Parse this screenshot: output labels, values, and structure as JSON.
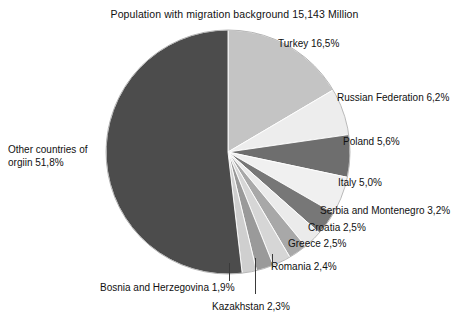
{
  "chart": {
    "title": "Population with migration background 15,143 Million",
    "geometry": {
      "center_x": 228,
      "center_y": 152,
      "radius": 122,
      "start_angle_deg": -90,
      "direction": "clockwise"
    }
  },
  "chart_data": {
    "type": "pie",
    "title": "Population with migration background 15,143 Million",
    "total_label": "15,143 Million",
    "value_suffix": "%",
    "decimal_separator": ",",
    "legend": "none",
    "grid": false,
    "categories": [
      "Turkey",
      "Russian Federation",
      "Poland",
      "Italy",
      "Serbia and Montenegro",
      "Croatia",
      "Greece",
      "Romania",
      "Kazakhstan",
      "Bosnia and Herzegovina",
      "Other countries of orgiin"
    ],
    "values": [
      16.5,
      6.2,
      5.6,
      5.0,
      3.2,
      2.5,
      2.5,
      2.4,
      2.3,
      1.9,
      51.8
    ],
    "value_texts": [
      "16,5",
      "6,2",
      "5,6",
      "5,0",
      "3,2",
      "2,5",
      "2,5",
      "2,4",
      "2,3",
      "1,9",
      "51,8"
    ],
    "colors": [
      "#c4c4c4",
      "#ededed",
      "#6e6e6e",
      "#f0f0f0",
      "#777777",
      "#ebebeb",
      "#a8a8a8",
      "#d6d6d6",
      "#9a9a9a",
      "#cfcfcf",
      "#4c4c4c"
    ],
    "slices": [
      {
        "name": "Turkey",
        "label": "Turkey 16,5%",
        "value": 16.5,
        "value_text": "16,5%",
        "color": "#c4c4c4",
        "label_x": 278,
        "label_y": 37,
        "leader": false
      },
      {
        "name": "Russian Federation",
        "label": "Russian Federation 6,2%",
        "value": 6.2,
        "value_text": "6,2%",
        "color": "#ededed",
        "label_x": 337,
        "label_y": 91,
        "leader": false
      },
      {
        "name": "Poland",
        "label": "Poland 5,6%",
        "value": 5.6,
        "value_text": "5,6%",
        "color": "#6e6e6e",
        "label_x": 343,
        "label_y": 135,
        "leader": false
      },
      {
        "name": "Italy",
        "label": "Italy 5,0%",
        "value": 5.0,
        "value_text": "5,0%",
        "color": "#f0f0f0",
        "label_x": 338,
        "label_y": 176,
        "leader": false
      },
      {
        "name": "Serbia and Montenegro",
        "label": "Serbia and Montenegro 3,2%",
        "value": 3.2,
        "value_text": "3,2%",
        "color": "#777777",
        "label_x": 320,
        "label_y": 204,
        "leader": false
      },
      {
        "name": "Croatia",
        "label": "Croatia 2,5%",
        "value": 2.5,
        "value_text": "2,5%",
        "color": "#ebebeb",
        "label_x": 308,
        "label_y": 221,
        "leader": false
      },
      {
        "name": "Greece",
        "label": "Greece 2,5%",
        "value": 2.5,
        "value_text": "2,5%",
        "color": "#a8a8a8",
        "label_x": 288,
        "label_y": 237,
        "leader": false
      },
      {
        "name": "Romania",
        "label": "Romania 2,4%",
        "value": 2.4,
        "value_text": "2,4%",
        "color": "#d6d6d6",
        "label_x": 271,
        "label_y": 260,
        "leader": true
      },
      {
        "name": "Kazakhstan",
        "label": "Kazakhstan 2,3%",
        "value": 2.3,
        "value_text": "2,3%",
        "color": "#9a9a9a",
        "label_x": 212,
        "label_y": 300,
        "leader": true
      },
      {
        "name": "Bosnia and Herzegovina",
        "label": "Bosnia and Herzegovina 1,9%",
        "value": 1.9,
        "value_text": "1,9%",
        "color": "#cfcfcf",
        "label_x": 100,
        "label_y": 281,
        "leader": true
      },
      {
        "name": "Other countries of orgiin",
        "label": "Other countries of orgiin 51,8%",
        "value": 51.8,
        "value_text": "51,8%",
        "color": "#4c4c4c",
        "label_x": 8,
        "label_y": 143,
        "leader": false
      }
    ],
    "leader_lines": [
      {
        "name": "romania-leader",
        "x": 272,
        "y_top": 254,
        "height": 14
      },
      {
        "name": "kazakhstan-leader",
        "x": 255,
        "y_top": 258,
        "height": 36
      },
      {
        "name": "bosnia-leader",
        "x": 229,
        "y_top": 263,
        "height": 18
      }
    ]
  },
  "labels": {
    "other_countries_line1": "Other countries of",
    "other_countries_line2": "orgiin 51,8%"
  }
}
